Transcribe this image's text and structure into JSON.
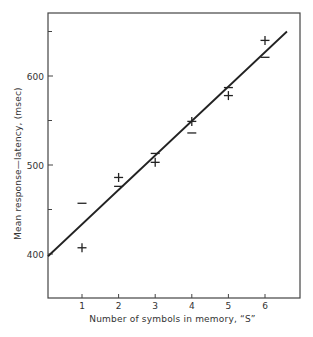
{
  "chart_data": {
    "type": "scatter",
    "title": "",
    "xlabel": "Number of symbols in memory, “S”",
    "ylabel": "Mean response—latency, (msec)",
    "xlim": [
      0,
      7
    ],
    "ylim": [
      300,
      670
    ],
    "x_ticks": [
      1,
      2,
      3,
      4,
      5,
      6
    ],
    "y_ticks": [
      400,
      500,
      600
    ],
    "y_minor_ticks": [
      450,
      550,
      650
    ],
    "grid": false,
    "legend": null,
    "series": [
      {
        "name": "positive responses",
        "marker": "+",
        "x": [
          1,
          2,
          3,
          4,
          5,
          6
        ],
        "y": [
          407,
          486,
          503,
          549,
          578,
          640
        ]
      },
      {
        "name": "negative responses",
        "marker": "−",
        "x": [
          1,
          2,
          3,
          4,
          5,
          6
        ],
        "y": [
          457,
          476,
          513,
          536,
          587,
          621
        ]
      }
    ],
    "fit_line": {
      "x": [
        0,
        6.6
      ],
      "y": [
        397.5,
        650
      ],
      "slope": 38,
      "intercept": 397.5
    },
    "colors": {
      "ink": "#222222",
      "background": "#ffffff"
    }
  },
  "axes": {
    "xlabel": "Number of symbols in memory, “S”",
    "ylabel": "Mean response—latency, (msec)"
  }
}
